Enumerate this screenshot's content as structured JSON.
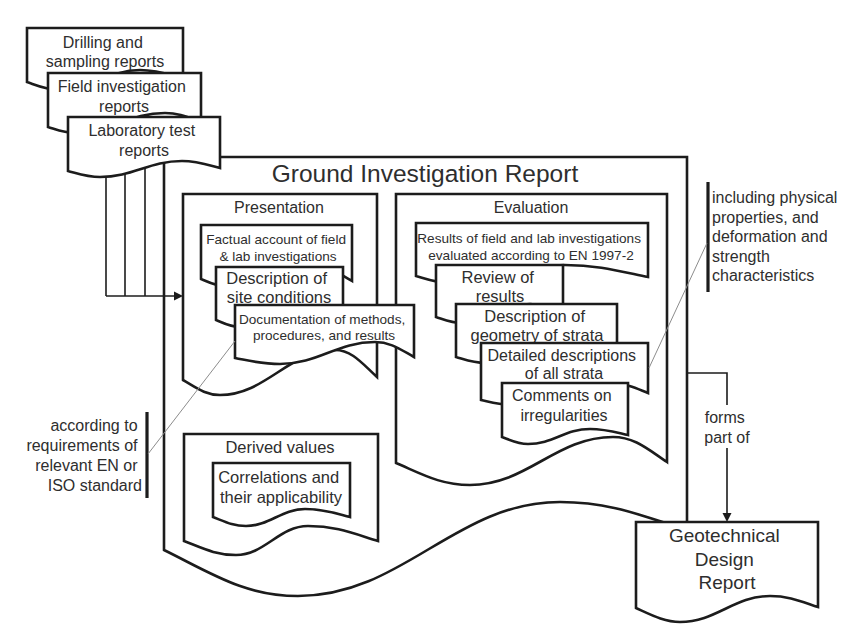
{
  "diagram": {
    "report_title": "Ground Investigation Report",
    "input_reports": [
      {
        "lines": [
          "Drilling and",
          "sampling reports"
        ]
      },
      {
        "lines": [
          "Field investigation",
          "reports"
        ]
      },
      {
        "lines": [
          "Laboratory test",
          "reports"
        ]
      }
    ],
    "presentation": {
      "heading": "Presentation",
      "items": [
        {
          "lines": [
            "Factual account of field",
            "& lab investigations"
          ]
        },
        {
          "lines": [
            "Description of",
            "site conditions"
          ]
        },
        {
          "lines": [
            "Documentation of methods,",
            "procedures, and results"
          ]
        }
      ]
    },
    "evaluation": {
      "heading": "Evaluation",
      "items": [
        {
          "lines": [
            "Results of field and lab investigations",
            "evaluated according to EN 1997-2"
          ]
        },
        {
          "lines": [
            "Review of",
            "results"
          ]
        },
        {
          "lines": [
            "Description of",
            "geometry of strata"
          ]
        },
        {
          "lines": [
            "Detailed descriptions",
            "of all strata"
          ]
        },
        {
          "lines": [
            "Comments on",
            "irregularities"
          ]
        }
      ]
    },
    "derived_values": {
      "heading": "Derived values",
      "items": [
        {
          "lines": [
            "Correlations and",
            "their applicability"
          ]
        }
      ]
    },
    "notes": {
      "standards": {
        "lines": [
          "according to",
          "requirements of",
          "relevant EN or",
          "ISO standard"
        ]
      },
      "properties": {
        "lines": [
          "including physical",
          "properties, and",
          "deformation and",
          "strength",
          "characteristics"
        ]
      }
    },
    "connector": {
      "lines": [
        "forms",
        "part of"
      ]
    },
    "output_report": {
      "lines": [
        "Geotechnical",
        "Design",
        "Report"
      ]
    }
  },
  "colors": {
    "bg": "#ffffff",
    "line": "#1c1c1c",
    "text": "#2e2e2e",
    "leader": "#8c8c8c",
    "fill": "#ffffff"
  }
}
